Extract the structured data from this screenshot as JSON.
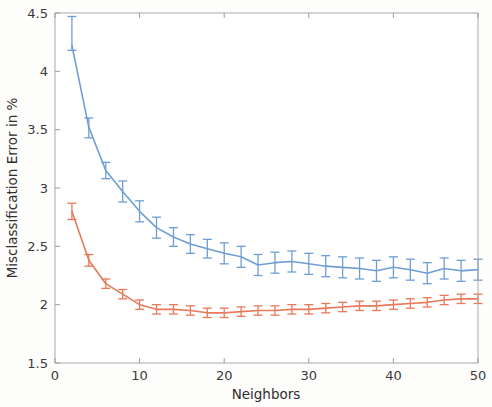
{
  "chart_data": {
    "type": "line",
    "title": "",
    "xlabel": "Neighbors",
    "ylabel": "Misclassification Error in %",
    "xlim": [
      0,
      50
    ],
    "ylim": [
      1.5,
      4.5
    ],
    "xticks": [
      0,
      10,
      20,
      30,
      40,
      50
    ],
    "xticklabels": [
      "0",
      "10",
      "20",
      "30",
      "40",
      "50"
    ],
    "yticks": [
      1.5,
      2,
      2.5,
      3,
      3.5,
      4,
      4.5
    ],
    "yticklabels": [
      "1.5",
      "2",
      "2.5",
      "3",
      "3.5",
      "4",
      "4.5"
    ],
    "grid": false,
    "legend": "none",
    "errorbars": true,
    "x": [
      2,
      4,
      6,
      8,
      10,
      12,
      14,
      16,
      18,
      20,
      22,
      24,
      26,
      28,
      30,
      32,
      34,
      36,
      38,
      40,
      42,
      44,
      46,
      48,
      50
    ],
    "series": [
      {
        "name": "blue-series",
        "color": "#6f9ed4",
        "values": [
          4.22,
          3.52,
          3.15,
          2.97,
          2.8,
          2.66,
          2.58,
          2.52,
          2.48,
          2.44,
          2.41,
          2.34,
          2.36,
          2.37,
          2.35,
          2.33,
          2.32,
          2.31,
          2.29,
          2.32,
          2.3,
          2.27,
          2.31,
          2.29,
          2.3
        ],
        "err_lower": [
          0.04,
          0.09,
          0.07,
          0.09,
          0.09,
          0.09,
          0.08,
          0.08,
          0.08,
          0.09,
          0.09,
          0.09,
          0.09,
          0.09,
          0.09,
          0.09,
          0.09,
          0.09,
          0.09,
          0.09,
          0.09,
          0.09,
          0.09,
          0.09,
          0.09
        ],
        "err_upper": [
          0.25,
          0.08,
          0.07,
          0.09,
          0.09,
          0.09,
          0.08,
          0.08,
          0.08,
          0.09,
          0.09,
          0.09,
          0.09,
          0.09,
          0.09,
          0.09,
          0.09,
          0.09,
          0.09,
          0.09,
          0.09,
          0.09,
          0.09,
          0.09,
          0.09
        ]
      },
      {
        "name": "orange-series",
        "color": "#e8795a",
        "values": [
          2.8,
          2.38,
          2.18,
          2.09,
          2.0,
          1.96,
          1.96,
          1.95,
          1.93,
          1.93,
          1.94,
          1.95,
          1.95,
          1.96,
          1.96,
          1.97,
          1.98,
          1.99,
          1.99,
          2.0,
          2.01,
          2.02,
          2.04,
          2.05,
          2.05
        ],
        "err_lower": [
          0.07,
          0.05,
          0.04,
          0.04,
          0.04,
          0.04,
          0.04,
          0.04,
          0.04,
          0.04,
          0.04,
          0.04,
          0.04,
          0.04,
          0.04,
          0.04,
          0.04,
          0.04,
          0.04,
          0.04,
          0.04,
          0.04,
          0.04,
          0.04,
          0.04
        ],
        "err_upper": [
          0.07,
          0.05,
          0.04,
          0.04,
          0.04,
          0.04,
          0.04,
          0.04,
          0.04,
          0.04,
          0.04,
          0.04,
          0.04,
          0.04,
          0.04,
          0.04,
          0.04,
          0.04,
          0.04,
          0.04,
          0.04,
          0.04,
          0.04,
          0.04,
          0.04
        ]
      }
    ]
  }
}
